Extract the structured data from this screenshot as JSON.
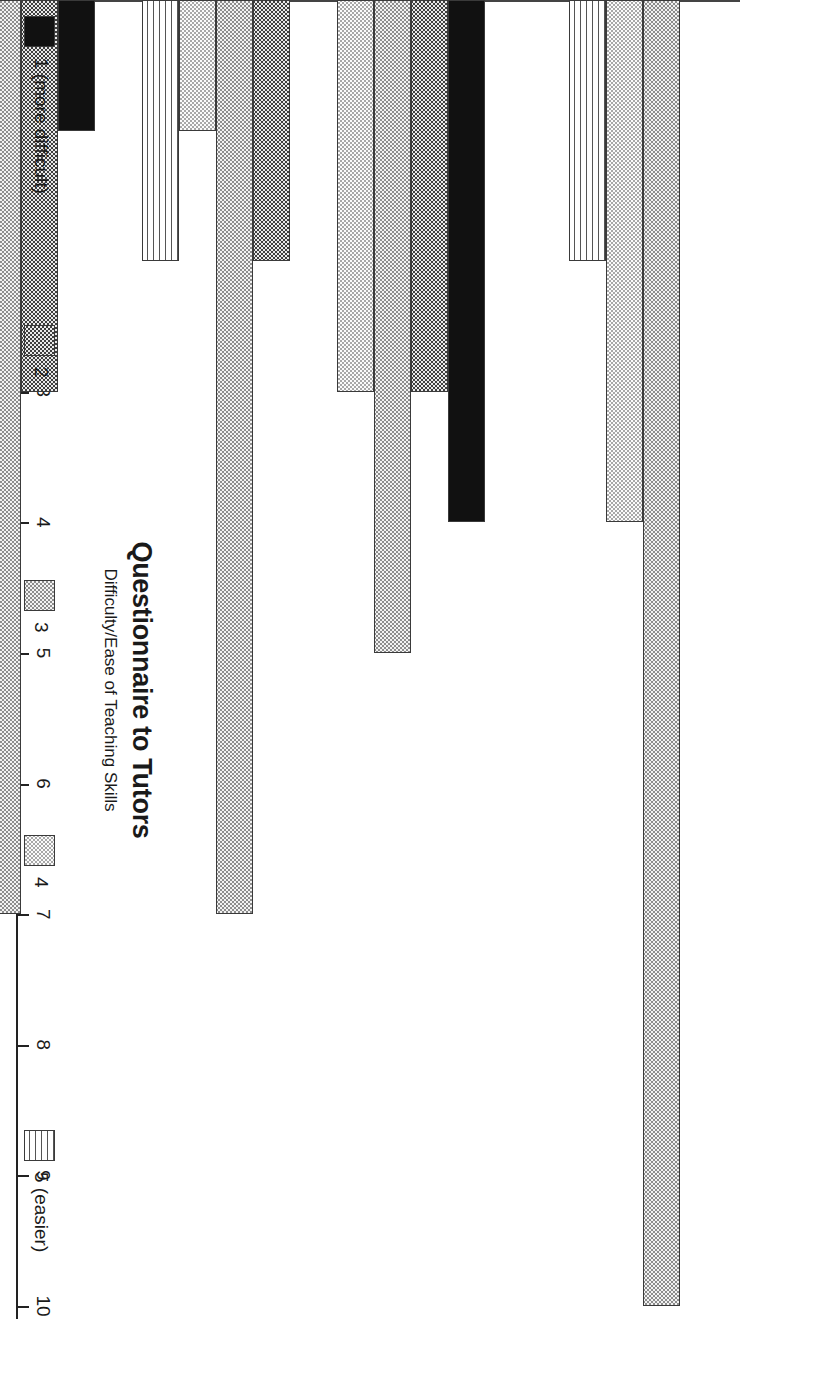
{
  "chart_data": {
    "type": "bar",
    "orientation": "horizontal",
    "title": "Questionnaire to Tutors",
    "subtitle": "Difficulty/Ease of Teaching Skills",
    "xlabel": "",
    "ylabel": "",
    "xlim": [
      0,
      10
    ],
    "grid": false,
    "legend_position": "left",
    "tick_labels": [
      "0",
      "1",
      "2",
      "3",
      "4",
      "5",
      "6",
      "7",
      "8",
      "9",
      "10"
    ],
    "categories": [
      "INTERVIEWING",
      "NEGOTIATION",
      "ADVOCACY",
      "LEGAL RESEARCH",
      "DRAFTING"
    ],
    "series": [
      {
        "name": "1 (more difficult)",
        "pattern": "solid-black",
        "values": [
          0,
          4,
          0,
          1,
          1
        ]
      },
      {
        "name": "2",
        "pattern": "dark-checker",
        "values": [
          0,
          3,
          2,
          3,
          6
        ]
      },
      {
        "name": "3",
        "pattern": "medium-checker",
        "values": [
          10,
          5,
          7,
          7,
          5
        ]
      },
      {
        "name": "4",
        "pattern": "light-dots",
        "values": [
          4,
          3,
          1,
          1,
          2
        ]
      },
      {
        "name": "5 (easier)",
        "pattern": "horizontal-lines",
        "values": [
          2,
          0,
          2,
          0,
          2
        ]
      }
    ]
  },
  "legend": {
    "items": [
      {
        "label": "1 (more difficult)"
      },
      {
        "label": "2"
      },
      {
        "label": "3"
      },
      {
        "label": "4"
      },
      {
        "label": "5 (easier)"
      }
    ]
  },
  "colors": {
    "axis": "#222222",
    "text": "#1a1a1a",
    "background": "#ffffff"
  }
}
